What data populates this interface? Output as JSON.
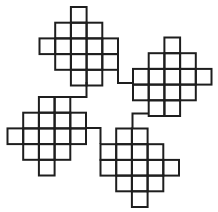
{
  "figure": {
    "width": 218,
    "height": 212,
    "background": "#ffffff",
    "stroke_color": "#1e1e1e",
    "stroke_width": 2,
    "cell_size": 15.7
  },
  "shapes": [
    {
      "name": "top-left-grid",
      "origin": [
        39.5,
        7
      ],
      "rows": [
        [
          2
        ],
        [
          1,
          2,
          3
        ],
        [
          0,
          1,
          2,
          3,
          4
        ],
        [
          1,
          2,
          3,
          4
        ],
        [
          2,
          3
        ]
      ]
    },
    {
      "name": "top-right-grid",
      "origin": [
        133,
        37.5
      ],
      "rows": [
        [
          2
        ],
        [
          1,
          2,
          3
        ],
        [
          0,
          1,
          2,
          3,
          4
        ],
        [
          0,
          1,
          2,
          3
        ],
        [
          1,
          2
        ]
      ]
    },
    {
      "name": "bottom-left-grid",
      "origin": [
        7.5,
        97
      ],
      "rows": [
        [
          2,
          3
        ],
        [
          1,
          2,
          3,
          4
        ],
        [
          0,
          1,
          2,
          3,
          4
        ],
        [
          1,
          2,
          3
        ],
        [
          2
        ]
      ]
    },
    {
      "name": "bottom-right-grid",
      "origin": [
        100.5,
        128.5
      ],
      "rows": [
        [
          1,
          2
        ],
        [
          0,
          1,
          2,
          3
        ],
        [
          0,
          1,
          2,
          3,
          4
        ],
        [
          1,
          2,
          3
        ],
        [
          2
        ]
      ]
    }
  ],
  "connectors": [
    {
      "name": "connector-top-left-to-top-right",
      "points": [
        [
          118,
          67
        ],
        [
          118,
          83
        ],
        [
          133,
          83
        ]
      ]
    },
    {
      "name": "connector-top-left-to-bottom-left",
      "points": [
        [
          86.5,
          82
        ],
        [
          86.5,
          97
        ],
        [
          70,
          97
        ]
      ]
    },
    {
      "name": "connector-bottom-left-to-bottom-right",
      "points": [
        [
          86,
          128
        ],
        [
          100.5,
          128
        ],
        [
          100.5,
          144
        ]
      ]
    },
    {
      "name": "connector-top-right-to-bottom-right",
      "points": [
        [
          149,
          113.5
        ],
        [
          132.5,
          113.5
        ],
        [
          132.5,
          128.5
        ]
      ]
    }
  ]
}
